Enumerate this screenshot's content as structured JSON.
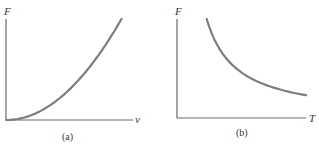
{
  "panels": [
    {
      "caption": "(a)",
      "y_label": "F",
      "x_label": "v",
      "relationship": "F increases quadratically with v (F ∝ v²)"
    },
    {
      "caption": "(b)",
      "y_label": "F",
      "x_label": "T",
      "relationship": "F decreases inversely with T (F ∝ 1/T)"
    }
  ],
  "chart_data": [
    {
      "type": "line",
      "title": "(a)",
      "xlabel": "v",
      "ylabel": "F",
      "x": [
        0,
        0.1,
        0.2,
        0.3,
        0.4,
        0.5,
        0.6,
        0.7,
        0.8,
        0.9,
        1.0
      ],
      "series": [
        {
          "name": "F(v)",
          "values": [
            0,
            0.01,
            0.04,
            0.09,
            0.16,
            0.25,
            0.36,
            0.49,
            0.64,
            0.81,
            1.0
          ]
        }
      ],
      "xlim": [
        0,
        1.1
      ],
      "ylim": [
        0,
        1.0
      ],
      "grid": false,
      "ticks": "none"
    },
    {
      "type": "line",
      "title": "(b)",
      "xlabel": "T",
      "ylabel": "F",
      "x": [
        0.23,
        0.3,
        0.4,
        0.5,
        0.6,
        0.7,
        0.8,
        0.9,
        1.0
      ],
      "series": [
        {
          "name": "F(T)",
          "values": [
            1.0,
            0.77,
            0.575,
            0.46,
            0.383,
            0.329,
            0.288,
            0.256,
            0.23
          ]
        }
      ],
      "xlim": [
        0,
        1.0
      ],
      "ylim": [
        0,
        1.0
      ],
      "grid": false,
      "ticks": "none"
    }
  ]
}
